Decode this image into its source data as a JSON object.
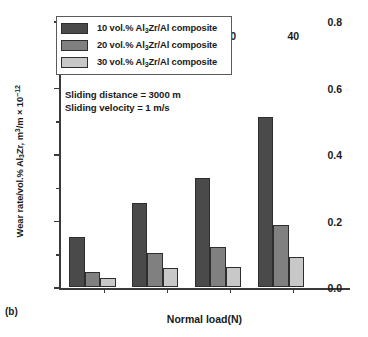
{
  "panel_label": "(b)",
  "annotations": [
    "Sliding distance = 3000 m",
    "Sliding velocity = 1 m/s"
  ],
  "legend": {
    "entries": [
      {
        "label_pre": "10 vol.% Al",
        "label_sub": "3",
        "label_post": "Zr/Al composite",
        "color": "#4a4a4a"
      },
      {
        "label_pre": "20 vol.% Al",
        "label_sub": "3",
        "label_post": "Zr/Al composite",
        "color": "#808080"
      },
      {
        "label_pre": "30 vol.% Al",
        "label_sub": "3",
        "label_post": "Zr/Al composite",
        "color": "#c8c8c8"
      }
    ]
  },
  "axes": {
    "ylabel_pre": "Wear rate/vol.% Al",
    "ylabel_sub": "3",
    "ylabel_mid": "Zr, m",
    "ylabel_sup": "3",
    "ylabel_post": "/m × 10",
    "ylabel_exp": "−12",
    "xlabel": "Normal load(N)",
    "ytick_labels": [
      "0.0",
      "0.2",
      "0.4",
      "0.6",
      "0.8"
    ],
    "xtick_labels": [
      "10",
      "20",
      "30",
      "40"
    ]
  },
  "chart_data": {
    "type": "bar",
    "title": "",
    "categories": [
      "10",
      "20",
      "30",
      "40"
    ],
    "series": [
      {
        "name": "10 vol.% Al3Zr/Al composite",
        "color": "#4a4a4a",
        "values": [
          0.15,
          0.25,
          0.325,
          0.51
        ]
      },
      {
        "name": "20 vol.% Al3Zr/Al composite",
        "color": "#808080",
        "values": [
          0.045,
          0.1,
          0.12,
          0.185
        ]
      },
      {
        "name": "30 vol.% Al3Zr/Al composite",
        "color": "#c8c8c8",
        "values": [
          0.025,
          0.055,
          0.06,
          0.09
        ]
      }
    ],
    "xlabel": "Normal load(N)",
    "ylabel": "Wear rate/vol.% Al3Zr, m3/m × 10-12",
    "ylim": [
      0.0,
      0.8
    ],
    "yticks": [
      0.0,
      0.2,
      0.4,
      0.6,
      0.8
    ],
    "yminor_ticks": [
      0.1,
      0.3,
      0.5,
      0.7
    ],
    "grid": false,
    "legend_position": "upper-left",
    "annotations": [
      "Sliding distance = 3000 m",
      "Sliding velocity = 1 m/s"
    ],
    "panel_label": "(b)"
  }
}
